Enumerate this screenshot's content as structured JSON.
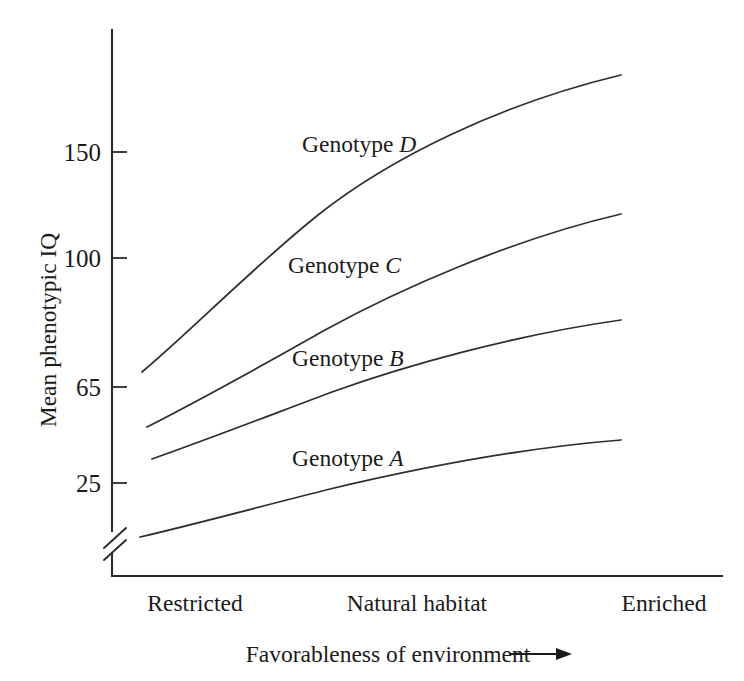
{
  "chart_data": {
    "type": "line",
    "title": "",
    "subtitle": "",
    "xlabel": "Favorableness of environment ⟶",
    "xlabel_text": "Favorableness of environment",
    "xlabel_arrow": "⟶",
    "ylabel": "Mean phenotypic IQ",
    "grid": false,
    "legend_position": "inline-labels",
    "axis_break": true,
    "axis_break_note": "broken y-axis below 25",
    "x_categories": [
      "Restricted",
      "Natural habitat",
      "Enriched"
    ],
    "x_tick_labels": [
      "Restricted",
      "Natural habitat",
      "Enriched"
    ],
    "y_tick_labels": [
      "150",
      "100",
      "65",
      "25"
    ],
    "y_tick_values": [
      150,
      100,
      65,
      25
    ],
    "ylim": [
      10,
      185
    ],
    "xlim": [
      0,
      1
    ],
    "annotations": [
      {
        "text": "Genotype D",
        "italic_part": "D",
        "x": 0.33,
        "y": 148
      },
      {
        "text": "Genotype C",
        "italic_part": "C",
        "x": 0.31,
        "y": 101
      },
      {
        "text": "Genotype B",
        "italic_part": "B",
        "x": 0.31,
        "y": 70
      },
      {
        "text": "Genotype A",
        "italic_part": "A",
        "x": 0.31,
        "y": 34
      }
    ],
    "series": [
      {
        "name": "Genotype D",
        "label": "Genotype D",
        "color": "#2e2e2e",
        "x": [
          0.05,
          0.17,
          0.3,
          0.45,
          0.62,
          0.8,
          1.0
        ],
        "values": [
          70,
          92,
          112,
          134,
          155,
          172,
          183
        ]
      },
      {
        "name": "Genotype C",
        "label": "Genotype C",
        "color": "#2e2e2e",
        "x": [
          0.05,
          0.17,
          0.3,
          0.45,
          0.62,
          0.8,
          1.0
        ],
        "values": [
          50,
          60,
          70,
          83,
          98,
          113,
          122
        ]
      },
      {
        "name": "Genotype B",
        "label": "Genotype B",
        "color": "#2e2e2e",
        "x": [
          0.05,
          0.17,
          0.3,
          0.45,
          0.62,
          0.8,
          1.0
        ],
        "values": [
          41,
          47,
          53,
          60,
          66,
          72,
          76
        ]
      },
      {
        "name": "Genotype A",
        "label": "Genotype A",
        "color": "#2e2e2e",
        "x": [
          0.05,
          0.17,
          0.3,
          0.45,
          0.62,
          0.8,
          1.0
        ],
        "values": [
          17,
          21,
          24,
          27,
          29,
          31,
          32
        ]
      }
    ]
  },
  "figure": {
    "background_color": "#ffffff",
    "ink_color": "#1a1a1a"
  }
}
